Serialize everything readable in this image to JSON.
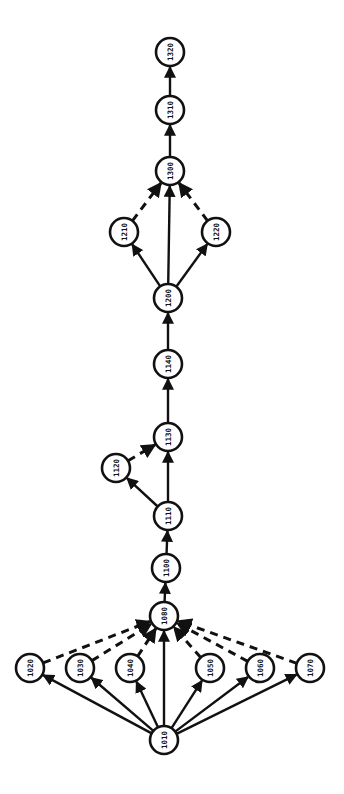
{
  "diagram": {
    "type": "directed-graph",
    "node_radius": 14,
    "nodes": [
      {
        "id": "1320",
        "label": "1320",
        "x": 170,
        "y": 52
      },
      {
        "id": "1310",
        "label": "1310",
        "x": 170,
        "y": 110
      },
      {
        "id": "1300",
        "label": "1300",
        "x": 170,
        "y": 171
      },
      {
        "id": "1210",
        "label": "1210",
        "x": 124,
        "y": 232
      },
      {
        "id": "1220",
        "label": "1220",
        "x": 216,
        "y": 232
      },
      {
        "id": "1200",
        "label": "1200",
        "x": 168,
        "y": 298
      },
      {
        "id": "1140",
        "label": "1140",
        "x": 168,
        "y": 364
      },
      {
        "id": "1130",
        "label": "1130",
        "x": 168,
        "y": 437
      },
      {
        "id": "1120",
        "label": "1120",
        "x": 116,
        "y": 468
      },
      {
        "id": "1110",
        "label": "1110",
        "x": 168,
        "y": 516
      },
      {
        "id": "1100",
        "label": "1100",
        "x": 166,
        "y": 568
      },
      {
        "id": "1080",
        "label": "1080",
        "x": 164,
        "y": 616
      },
      {
        "id": "1020",
        "label": "1020",
        "x": 30,
        "y": 668
      },
      {
        "id": "1030",
        "label": "1030",
        "x": 80,
        "y": 668
      },
      {
        "id": "1040",
        "label": "1040",
        "x": 130,
        "y": 668
      },
      {
        "id": "1050",
        "label": "1050",
        "x": 210,
        "y": 668
      },
      {
        "id": "1060",
        "label": "1060",
        "x": 260,
        "y": 668
      },
      {
        "id": "1070",
        "label": "1070",
        "x": 310,
        "y": 668
      },
      {
        "id": "1010",
        "label": "1010",
        "x": 164,
        "y": 740
      }
    ],
    "edges": [
      {
        "from": "1310",
        "to": "1320",
        "style": "solid"
      },
      {
        "from": "1300",
        "to": "1310",
        "style": "solid"
      },
      {
        "from": "1210",
        "to": "1300",
        "style": "dashed"
      },
      {
        "from": "1220",
        "to": "1300",
        "style": "dashed"
      },
      {
        "from": "1200",
        "to": "1300",
        "style": "solid"
      },
      {
        "from": "1200",
        "to": "1210",
        "style": "solid"
      },
      {
        "from": "1200",
        "to": "1220",
        "style": "solid"
      },
      {
        "from": "1140",
        "to": "1200",
        "style": "solid"
      },
      {
        "from": "1130",
        "to": "1140",
        "style": "solid"
      },
      {
        "from": "1120",
        "to": "1130",
        "style": "dashed"
      },
      {
        "from": "1110",
        "to": "1130",
        "style": "solid"
      },
      {
        "from": "1110",
        "to": "1120",
        "style": "solid"
      },
      {
        "from": "1100",
        "to": "1110",
        "style": "solid"
      },
      {
        "from": "1080",
        "to": "1100",
        "style": "solid"
      },
      {
        "from": "1020",
        "to": "1080",
        "style": "dashed"
      },
      {
        "from": "1030",
        "to": "1080",
        "style": "dashed"
      },
      {
        "from": "1040",
        "to": "1080",
        "style": "dashed"
      },
      {
        "from": "1050",
        "to": "1080",
        "style": "dashed"
      },
      {
        "from": "1060",
        "to": "1080",
        "style": "dashed"
      },
      {
        "from": "1070",
        "to": "1080",
        "style": "dashed"
      },
      {
        "from": "1010",
        "to": "1080",
        "style": "solid"
      },
      {
        "from": "1010",
        "to": "1020",
        "style": "solid"
      },
      {
        "from": "1010",
        "to": "1030",
        "style": "solid"
      },
      {
        "from": "1010",
        "to": "1040",
        "style": "solid"
      },
      {
        "from": "1010",
        "to": "1050",
        "style": "solid"
      },
      {
        "from": "1010",
        "to": "1060",
        "style": "solid"
      },
      {
        "from": "1010",
        "to": "1070",
        "style": "solid"
      }
    ]
  }
}
